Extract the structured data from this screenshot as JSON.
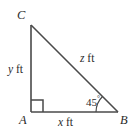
{
  "figure": {
    "type": "right-triangle-diagram",
    "stroke_color": "#4a4a4a",
    "text_color": "#2b2b2b",
    "background_color": "#ffffff",
    "vertices": [
      {
        "name": "C",
        "label": "C",
        "x": 31,
        "y": 25
      },
      {
        "name": "A",
        "label": "A",
        "x": 31,
        "y": 112
      },
      {
        "name": "B",
        "label": "B",
        "x": 118,
        "y": 112
      }
    ],
    "sides": [
      {
        "name": "leg-vertical-AC",
        "variable": "y",
        "unit": "ft",
        "label": "y ft"
      },
      {
        "name": "leg-horizontal-AB",
        "variable": "x",
        "unit": "ft",
        "label": "x ft"
      },
      {
        "name": "hypotenuse-CB",
        "variable": "z",
        "unit": "ft",
        "label": "z ft"
      }
    ],
    "angles": [
      {
        "name": "angle-at-B",
        "value": "45",
        "degree_symbol": "°",
        "label": "45°"
      },
      {
        "name": "angle-at-A",
        "value": "90",
        "marker": "right-angle-square",
        "label": ""
      }
    ]
  }
}
